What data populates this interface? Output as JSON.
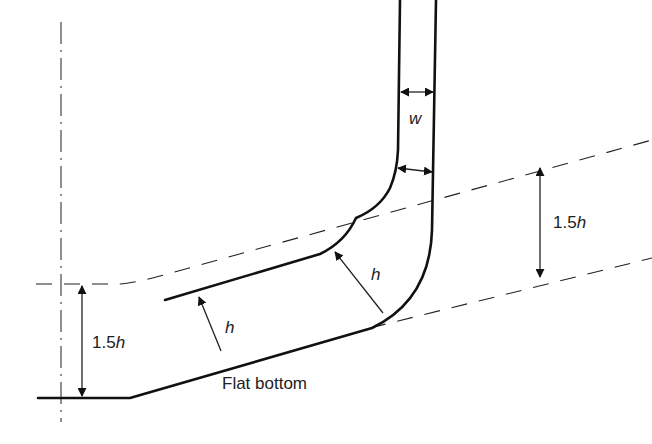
{
  "diagram": {
    "labels": {
      "wall_width": "w",
      "thickness_upper": "h",
      "thickness_lower": "h",
      "dim_right_num": "1.5",
      "dim_right_var": "h",
      "dim_left_num": "1.5",
      "dim_left_var": "h",
      "bottom_label": "Flat bottom"
    },
    "colors": {
      "stroke": "#111111",
      "background": "#ffffff"
    }
  }
}
